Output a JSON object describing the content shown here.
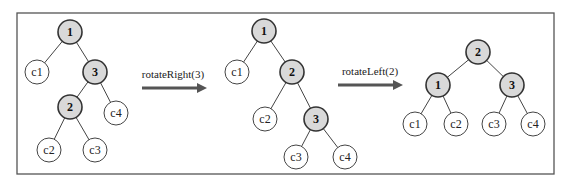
{
  "diagram": {
    "title": "",
    "frame": {
      "x": 17,
      "y": 13,
      "w": 537,
      "h": 161
    },
    "node_radius": 12,
    "colors": {
      "internal_fill": "#d9d9d9",
      "leaf_fill": "#ffffff",
      "stroke": "#333333",
      "arrow": "#555555"
    },
    "trees": [
      {
        "id": "tree-before",
        "nodes": [
          {
            "id": "n1",
            "label": "1",
            "type": "internal",
            "x": 70,
            "y": 32
          },
          {
            "id": "c1",
            "label": "c1",
            "type": "leaf",
            "x": 37,
            "y": 72
          },
          {
            "id": "n3",
            "label": "3",
            "type": "internal",
            "x": 95,
            "y": 72
          },
          {
            "id": "n2",
            "label": "2",
            "type": "internal",
            "x": 70,
            "y": 107
          },
          {
            "id": "c4",
            "label": "c4",
            "type": "leaf",
            "x": 116,
            "y": 113
          },
          {
            "id": "c2",
            "label": "c2",
            "type": "leaf",
            "x": 49,
            "y": 150
          },
          {
            "id": "c3",
            "label": "c3",
            "type": "leaf",
            "x": 95,
            "y": 150
          }
        ],
        "edges": [
          [
            "n1",
            "c1"
          ],
          [
            "n1",
            "n3"
          ],
          [
            "n3",
            "n2"
          ],
          [
            "n3",
            "c4"
          ],
          [
            "n2",
            "c2"
          ],
          [
            "n2",
            "c3"
          ]
        ]
      },
      {
        "id": "tree-middle",
        "nodes": [
          {
            "id": "n1",
            "label": "1",
            "type": "internal",
            "x": 264,
            "y": 31
          },
          {
            "id": "c1",
            "label": "c1",
            "type": "leaf",
            "x": 237,
            "y": 72
          },
          {
            "id": "n2",
            "label": "2",
            "type": "internal",
            "x": 292,
            "y": 72
          },
          {
            "id": "c2",
            "label": "c2",
            "type": "leaf",
            "x": 265,
            "y": 119
          },
          {
            "id": "n3",
            "label": "3",
            "type": "internal",
            "x": 316,
            "y": 119
          },
          {
            "id": "c3",
            "label": "c3",
            "type": "leaf",
            "x": 296,
            "y": 157
          },
          {
            "id": "c4",
            "label": "c4",
            "type": "leaf",
            "x": 345,
            "y": 157
          }
        ],
        "edges": [
          [
            "n1",
            "c1"
          ],
          [
            "n1",
            "n2"
          ],
          [
            "n2",
            "c2"
          ],
          [
            "n2",
            "n3"
          ],
          [
            "n3",
            "c3"
          ],
          [
            "n3",
            "c4"
          ]
        ]
      },
      {
        "id": "tree-after",
        "nodes": [
          {
            "id": "n2",
            "label": "2",
            "type": "internal",
            "x": 478,
            "y": 52
          },
          {
            "id": "n1",
            "label": "1",
            "type": "internal",
            "x": 438,
            "y": 85
          },
          {
            "id": "n3",
            "label": "3",
            "type": "internal",
            "x": 512,
            "y": 85
          },
          {
            "id": "c1",
            "label": "c1",
            "type": "leaf",
            "x": 415,
            "y": 124
          },
          {
            "id": "c2",
            "label": "c2",
            "type": "leaf",
            "x": 456,
            "y": 124
          },
          {
            "id": "c3",
            "label": "c3",
            "type": "leaf",
            "x": 494,
            "y": 124
          },
          {
            "id": "c4",
            "label": "c4",
            "type": "leaf",
            "x": 533,
            "y": 124
          }
        ],
        "edges": [
          [
            "n2",
            "n1"
          ],
          [
            "n2",
            "n3"
          ],
          [
            "n1",
            "c1"
          ],
          [
            "n1",
            "c2"
          ],
          [
            "n3",
            "c3"
          ],
          [
            "n3",
            "c4"
          ]
        ]
      }
    ],
    "operations": [
      {
        "id": "op-rotate-right",
        "label": "rotateRight(3)",
        "label_x": 173,
        "label_y": 78,
        "x1": 142,
        "x2": 207,
        "y": 88
      },
      {
        "id": "op-rotate-left",
        "label": "rotateLeft(2)",
        "label_x": 370,
        "label_y": 75,
        "x1": 338,
        "x2": 403,
        "y": 85
      }
    ]
  }
}
